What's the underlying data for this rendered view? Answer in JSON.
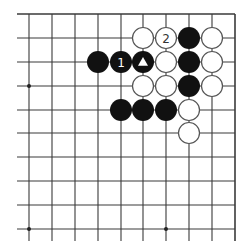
{
  "diagram": {
    "type": "go-board-fragment",
    "grid": {
      "cols_x": [
        29,
        52,
        75,
        98,
        121,
        143,
        166,
        189,
        212,
        235
      ],
      "rows_y": [
        14,
        38,
        62,
        86,
        110,
        133,
        157,
        181,
        205,
        229
      ],
      "top_edge": true,
      "right_edge": true,
      "line_extend_left": 17,
      "line_extend_bottom": 241,
      "line_color": "#3a3a3a"
    },
    "star_points": [
      {
        "col": 0,
        "row": 3
      },
      {
        "col": 0,
        "row": 9
      },
      {
        "col": 6,
        "row": 9
      }
    ],
    "stone_radius": 11,
    "stones": [
      {
        "color": "white",
        "col": 5,
        "row": 1,
        "label": ""
      },
      {
        "color": "white",
        "col": 6,
        "row": 1,
        "label": "2"
      },
      {
        "color": "black",
        "col": 7,
        "row": 1,
        "label": ""
      },
      {
        "color": "white",
        "col": 8,
        "row": 1,
        "label": ""
      },
      {
        "color": "black",
        "col": 3,
        "row": 2,
        "label": ""
      },
      {
        "color": "black",
        "col": 4,
        "row": 2,
        "label": "1"
      },
      {
        "color": "black",
        "col": 5,
        "row": 2,
        "label": "",
        "marker": "triangle"
      },
      {
        "color": "white",
        "col": 6,
        "row": 2,
        "label": ""
      },
      {
        "color": "black",
        "col": 7,
        "row": 2,
        "label": ""
      },
      {
        "color": "white",
        "col": 8,
        "row": 2,
        "label": ""
      },
      {
        "color": "white",
        "col": 5,
        "row": 3,
        "label": ""
      },
      {
        "color": "white",
        "col": 6,
        "row": 3,
        "label": ""
      },
      {
        "color": "black",
        "col": 7,
        "row": 3,
        "label": ""
      },
      {
        "color": "white",
        "col": 8,
        "row": 3,
        "label": ""
      },
      {
        "color": "black",
        "col": 4,
        "row": 4,
        "label": ""
      },
      {
        "color": "black",
        "col": 5,
        "row": 4,
        "label": ""
      },
      {
        "color": "black",
        "col": 6,
        "row": 4,
        "label": ""
      },
      {
        "color": "white",
        "col": 7,
        "row": 4,
        "label": ""
      },
      {
        "color": "white",
        "col": 7,
        "row": 5,
        "label": ""
      }
    ],
    "colors": {
      "black_stone": "#111111",
      "white_stone": "#ffffff",
      "white_outline": "#555555",
      "black_label": "#ffffff",
      "white_label": "#333333"
    }
  }
}
